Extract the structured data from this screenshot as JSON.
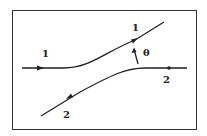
{
  "diagram": {
    "colors": {
      "stroke": "#222222",
      "background": "#ffffff"
    },
    "paths": [
      {
        "id": "path-1",
        "label_in": "1",
        "label_out": "1",
        "direction": "left-to-right, deflected upward"
      },
      {
        "id": "path-2",
        "label_in": "2",
        "label_out": "2",
        "direction": "right-to-left, deflected downward"
      }
    ],
    "angle_label": "θ"
  }
}
